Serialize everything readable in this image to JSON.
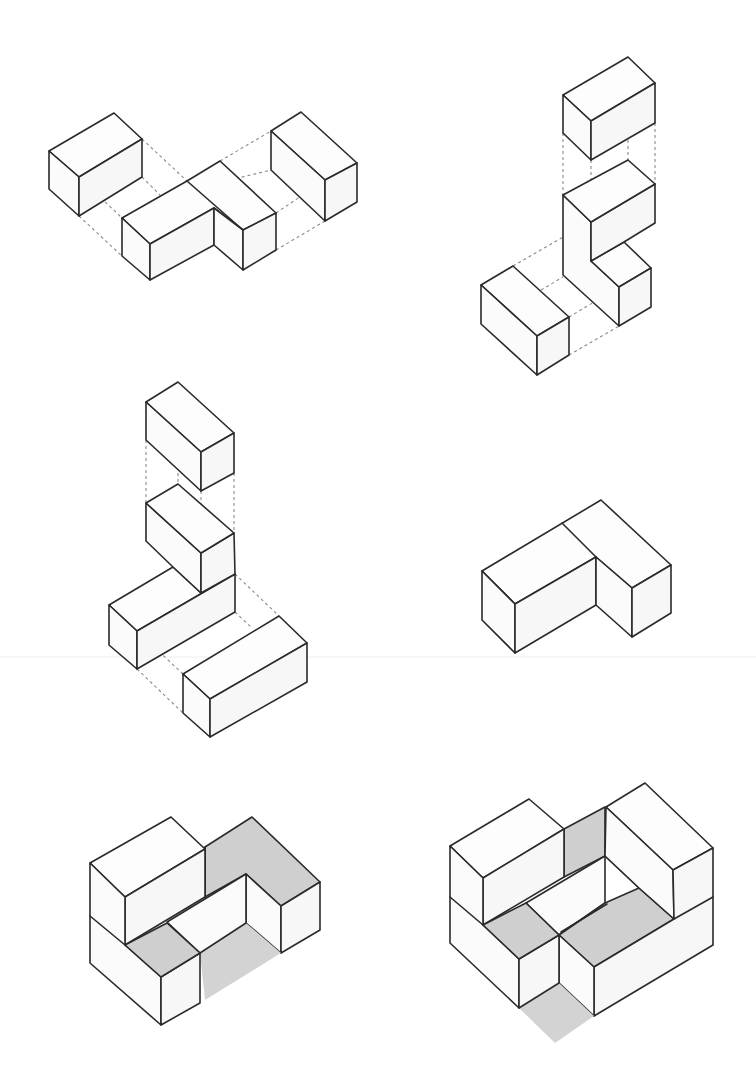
{
  "diagram": {
    "title": "",
    "colors": {
      "background": "#ffffff",
      "line": "#2a2a2a",
      "face_white": "#fdfdfd",
      "face_gray": "#cfcfcf",
      "dash": "#8a8a8a"
    },
    "figures": [
      {
        "id": "fig1",
        "label": "exploded-horizontal-assembly",
        "position": "top-left",
        "blocks": 3
      },
      {
        "id": "fig2",
        "label": "exploded-vertical-stack",
        "position": "top-right",
        "blocks": 4
      },
      {
        "id": "fig3",
        "label": "exploded-tower-assembly",
        "position": "middle-left",
        "blocks": 4
      },
      {
        "id": "fig4",
        "label": "assembled-l-shape",
        "position": "middle-right",
        "blocks": 2
      },
      {
        "id": "fig5",
        "label": "assembled-solid-with-gray-shading",
        "position": "bottom-left",
        "blocks": 4
      },
      {
        "id": "fig6",
        "label": "assembled-interlocking-solid-with-gray-shading",
        "position": "bottom-right",
        "blocks": 5
      }
    ]
  }
}
